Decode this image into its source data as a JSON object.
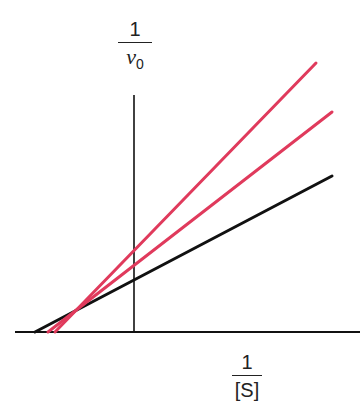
{
  "figure": {
    "type": "Lineweaver-Burk double-reciprocal plot",
    "y_axis_label": {
      "numerator": "1",
      "denominator_symbol": "ν",
      "denominator_subscript": "0"
    },
    "x_axis_label": {
      "numerator": "1",
      "denominator": "[S]"
    },
    "colors": {
      "axis": "#111111",
      "control_line": "#111111",
      "inhibitor_line": "#e03a5c"
    },
    "lines": [
      {
        "name": "no-inhibitor",
        "color": "#111111",
        "x1": 35,
        "y1": 332,
        "x2": 332,
        "y2": 176
      },
      {
        "name": "inhibitor-low",
        "color": "#e03a5c",
        "x1": 48,
        "y1": 332,
        "x2": 332,
        "y2": 112
      },
      {
        "name": "inhibitor-high",
        "color": "#e03a5c",
        "x1": 55,
        "y1": 332,
        "x2": 316,
        "y2": 63
      }
    ]
  }
}
